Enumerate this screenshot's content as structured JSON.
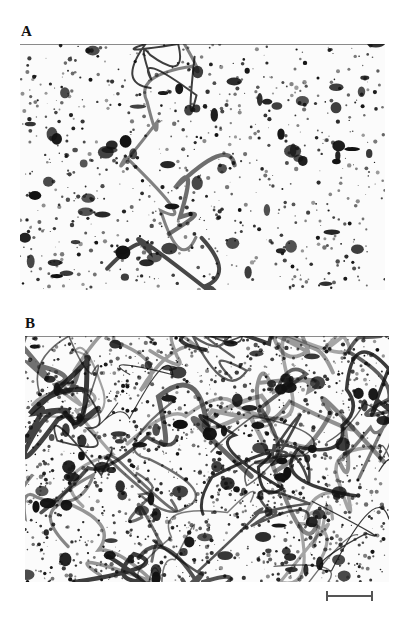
{
  "figure": {
    "panels": [
      {
        "id": "A",
        "label": "A",
        "label_pos": {
          "x": 21,
          "y": 24
        },
        "rect": {
          "x": 20,
          "y": 44,
          "w": 365,
          "h": 246
        },
        "texture": {
          "seed": 7,
          "dots": 700,
          "blobs": 70,
          "strands": 4,
          "density": "sparse"
        }
      },
      {
        "id": "B",
        "label": "B",
        "label_pos": {
          "x": 25,
          "y": 316
        },
        "rect": {
          "x": 25,
          "y": 336,
          "w": 364,
          "h": 246
        },
        "texture": {
          "seed": 19,
          "dots": 1400,
          "blobs": 90,
          "strands": 40,
          "density": "dense-network"
        }
      }
    ],
    "scale_bar": {
      "x": 326,
      "y": 595,
      "w": 47
    }
  },
  "colors": {
    "ink": "#111111",
    "mid": "#555555",
    "paper": "#fbfbfb"
  }
}
